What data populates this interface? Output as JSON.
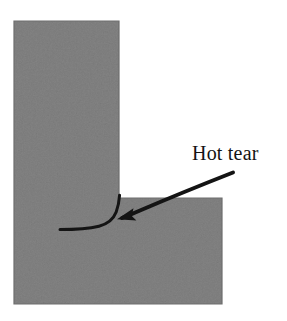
{
  "figure": {
    "caption_text": "Hot tear",
    "background_color": "#ffffff",
    "casting_fill_color": "#808080",
    "casting_edge_color": "#6e6e6e",
    "crack_color": "#141414",
    "annotation_color": "#141414",
    "label_color": "#141414"
  },
  "annotations": {
    "hot_tear_label": "Hot tear"
  },
  "geometry": {
    "vertical_section": {
      "x": 14,
      "y": 21,
      "width": 105,
      "height": 283
    },
    "horizontal_section": {
      "x": 14,
      "y": 198,
      "width": 208,
      "height": 106
    },
    "reentrant_corner": {
      "x": 120,
      "y": 197
    },
    "crack_start": {
      "x": 60,
      "y": 229
    },
    "crack_end": {
      "x": 120,
      "y": 195
    },
    "arrow_tail": {
      "x": 233,
      "y": 173
    },
    "arrow_head": {
      "x": 118,
      "y": 219
    }
  }
}
